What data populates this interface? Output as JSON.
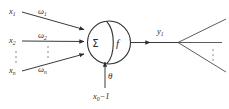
{
  "diagram": {
    "type": "neuron-schematic",
    "background_color": "#ffffff",
    "line_color": "#3a3a3a",
    "text_color": "#2b2b2b"
  },
  "inputs": [
    {
      "id": "input-1",
      "label": "x",
      "subscript": "1",
      "weight_label": "ω",
      "weight_subscript": "1"
    },
    {
      "id": "input-2",
      "label": "x",
      "subscript": "2",
      "weight_label": "ω",
      "weight_subscript": "2"
    },
    {
      "id": "input-n",
      "label": "x",
      "subscript": "n",
      "weight_label": "ω",
      "weight_subscript": "n"
    }
  ],
  "ellipsis": {
    "input_column": "⋮",
    "weight_column": "⋮",
    "output_fan": "⋮"
  },
  "body": {
    "sum_symbol": "Σ",
    "activation_symbol": "f",
    "shape": "circle-split"
  },
  "bias": {
    "threshold_label": "θ",
    "source_label": "x",
    "source_subscript": "0",
    "source_value": "−1"
  },
  "output": {
    "label": "y",
    "subscript": "1",
    "fan_branches": 3
  }
}
